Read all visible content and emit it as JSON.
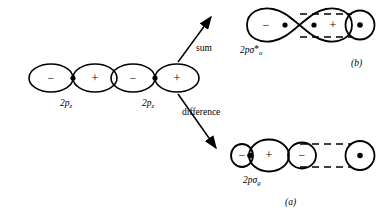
{
  "figure": {
    "caption_panels": {
      "top": "(b)",
      "bottom": "(a)"
    },
    "arrows": {
      "sum": "sum",
      "difference": "difference"
    },
    "atomic_orbitals": [
      {
        "id": "ao-left",
        "label_base": "2p",
        "label_sub": "z",
        "lobes": [
          {
            "sign": "−",
            "position": "left"
          },
          {
            "sign": "+",
            "position": "right"
          }
        ]
      },
      {
        "id": "ao-right",
        "label_base": "2p",
        "label_sub": "z",
        "lobes": [
          {
            "sign": "−",
            "position": "left"
          },
          {
            "sign": "+",
            "position": "right"
          }
        ]
      }
    ],
    "molecular_orbitals": [
      {
        "id": "mo-antibonding",
        "panel": "(b)",
        "label_base": "2pσ",
        "label_star": "*",
        "label_sub": "u",
        "type": "antibonding",
        "lobes": [
          {
            "sign": "−",
            "position": "left"
          },
          {
            "sign": "+",
            "position": "right"
          }
        ]
      },
      {
        "id": "mo-bonding",
        "panel": "(a)",
        "label_base": "2pσ",
        "label_star": "",
        "label_sub": "g",
        "type": "bonding",
        "lobes": [
          {
            "sign": "−",
            "position": "left"
          },
          {
            "sign": "+",
            "position": "center"
          },
          {
            "sign": "−",
            "position": "right"
          }
        ]
      }
    ],
    "colors": {
      "stroke": "#000000",
      "background": "#ffffff",
      "dashed_axis": "#000000"
    }
  }
}
